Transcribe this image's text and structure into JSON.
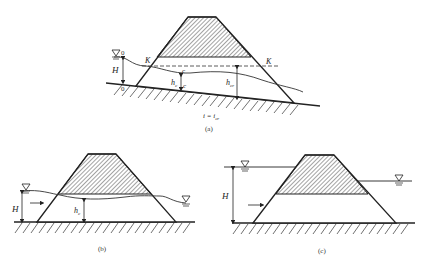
{
  "figure": {
    "panels": [
      {
        "id": "a",
        "caption": "(a)",
        "labels": {
          "upstream_level": "0",
          "bed_point": "0",
          "head": "H",
          "critical_line_left": "K",
          "critical_line_right": "K",
          "section_top": "c",
          "section_bottom": "c",
          "contracted_depth": "h",
          "contracted_depth_sub": "c",
          "critical_depth": "h",
          "critical_depth_sub": "cr",
          "slope": "i = i",
          "slope_sub": "cr"
        }
      },
      {
        "id": "b",
        "caption": "(b)",
        "labels": {
          "head": "H",
          "depth": "h",
          "depth_sub": "c"
        }
      },
      {
        "id": "c",
        "caption": "(c)",
        "labels": {
          "head": "H"
        }
      }
    ],
    "colors": {
      "line": "#222222",
      "hatch": "#333333",
      "background": "#ffffff"
    }
  }
}
